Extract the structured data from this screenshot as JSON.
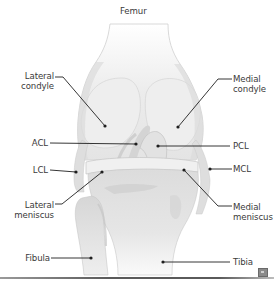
{
  "diagram": {
    "title": "Femur",
    "colors": {
      "bone_light": "#f2f2f2",
      "bone_mid": "#e3e3e3",
      "bone_shadow": "#cfcfcf",
      "cartilage": "#d9d9d9",
      "outline": "#bdbdbd",
      "leader_line": "#1f1f1f",
      "text": "#3a3a3a"
    },
    "labels": [
      {
        "id": "femur",
        "text": "Femur",
        "x": 120,
        "y": 6,
        "align": "left"
      },
      {
        "id": "lateral-condyle",
        "text": "Lateral\ncondyle",
        "x": 20,
        "y": 71,
        "align": "right",
        "w": 34,
        "line": [
          [
            55,
            77
          ],
          [
            63,
            77
          ],
          [
            105,
            126
          ]
        ],
        "dot": [
          105,
          126
        ]
      },
      {
        "id": "medial-condyle",
        "text": "Medial\ncondyle",
        "x": 233,
        "y": 74,
        "align": "left",
        "line": [
          [
            232,
            79
          ],
          [
            218,
            79
          ],
          [
            178,
            127
          ]
        ],
        "dot": [
          178,
          127
        ]
      },
      {
        "id": "acl",
        "text": "ACL",
        "x": 30,
        "y": 138,
        "align": "right",
        "w": 18,
        "line": [
          [
            50,
            143
          ],
          [
            136,
            144
          ]
        ],
        "dot": [
          136,
          144
        ]
      },
      {
        "id": "pcl",
        "text": "PCL",
        "x": 233,
        "y": 141,
        "align": "left",
        "line": [
          [
            230,
            146
          ],
          [
            158,
            146
          ]
        ],
        "dot": [
          158,
          146
        ]
      },
      {
        "id": "lcl",
        "text": "LCL",
        "x": 30,
        "y": 165,
        "align": "right",
        "w": 18,
        "line": [
          [
            50,
            170
          ],
          [
            76,
            172
          ]
        ],
        "dot": [
          76,
          172
        ]
      },
      {
        "id": "mcl",
        "text": "MCL",
        "x": 233,
        "y": 164,
        "align": "left",
        "line": [
          [
            232,
            169
          ],
          [
            210,
            169
          ]
        ],
        "dot": [
          210,
          169
        ]
      },
      {
        "id": "lateral-meniscus",
        "text": "Lateral\nmeniscus",
        "x": 8,
        "y": 200,
        "align": "right",
        "w": 46,
        "line": [
          [
            55,
            204
          ],
          [
            62,
            204
          ],
          [
            102,
            172
          ]
        ],
        "dot": [
          102,
          172
        ]
      },
      {
        "id": "medial-meniscus",
        "text": "Medial\nmeniscus",
        "x": 233,
        "y": 202,
        "align": "left",
        "line": [
          [
            232,
            206
          ],
          [
            218,
            206
          ],
          [
            184,
            170
          ]
        ],
        "dot": [
          184,
          170
        ]
      },
      {
        "id": "fibula",
        "text": "Fibula",
        "x": 20,
        "y": 253,
        "align": "right",
        "w": 30,
        "line": [
          [
            51,
            258
          ],
          [
            91,
            258
          ]
        ],
        "dot": [
          91,
          258
        ]
      },
      {
        "id": "tibia",
        "text": "Tibia",
        "x": 233,
        "y": 257,
        "align": "left",
        "line": [
          [
            230,
            262
          ],
          [
            163,
            262
          ]
        ],
        "dot": [
          163,
          262
        ]
      }
    ],
    "corner_icon": "enlarge-image-icon"
  }
}
